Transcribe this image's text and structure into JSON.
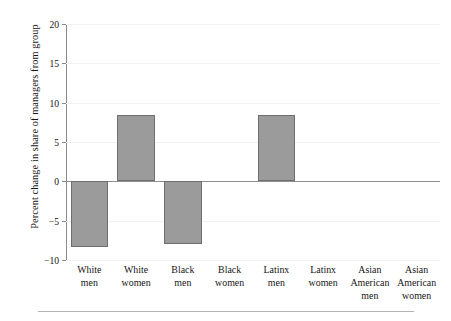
{
  "chart_data": {
    "type": "bar",
    "title": "",
    "subtitle": "",
    "xlabel": "",
    "ylabel": "Percent change in share of managers from group",
    "categories": [
      "White men",
      "White women",
      "Black men",
      "Black women",
      "Latinx men",
      "Latinx women",
      "Asian American men",
      "Asian American women"
    ],
    "category_lines": [
      [
        "White",
        "men"
      ],
      [
        "White",
        "women"
      ],
      [
        "Black",
        "men"
      ],
      [
        "Black",
        "women"
      ],
      [
        "Latinx",
        "men"
      ],
      [
        "Latinx",
        "women"
      ],
      [
        "Asian",
        "American",
        "men"
      ],
      [
        "Asian",
        "American",
        "women"
      ]
    ],
    "values": [
      -8.3,
      8.4,
      -8.0,
      0,
      8.4,
      0,
      0,
      0
    ],
    "ylim": [
      -10,
      20
    ],
    "yticks": [
      20,
      15,
      10,
      5,
      0,
      -5,
      -10
    ],
    "ytick_labels": [
      "20",
      "15",
      "10",
      "5",
      "0",
      "-5",
      "-10"
    ],
    "grid": true,
    "grid_axis": "y",
    "legend": "none",
    "bar_color": "#9b9b9b",
    "bar_edge_color": "#6e6e6e",
    "gridline_color": "#f2f2f2",
    "zeroline_color": "#8f8f8f",
    "axis_color": "#8a8a8a",
    "background_color": "#ffffff",
    "text_color": "#161616"
  }
}
